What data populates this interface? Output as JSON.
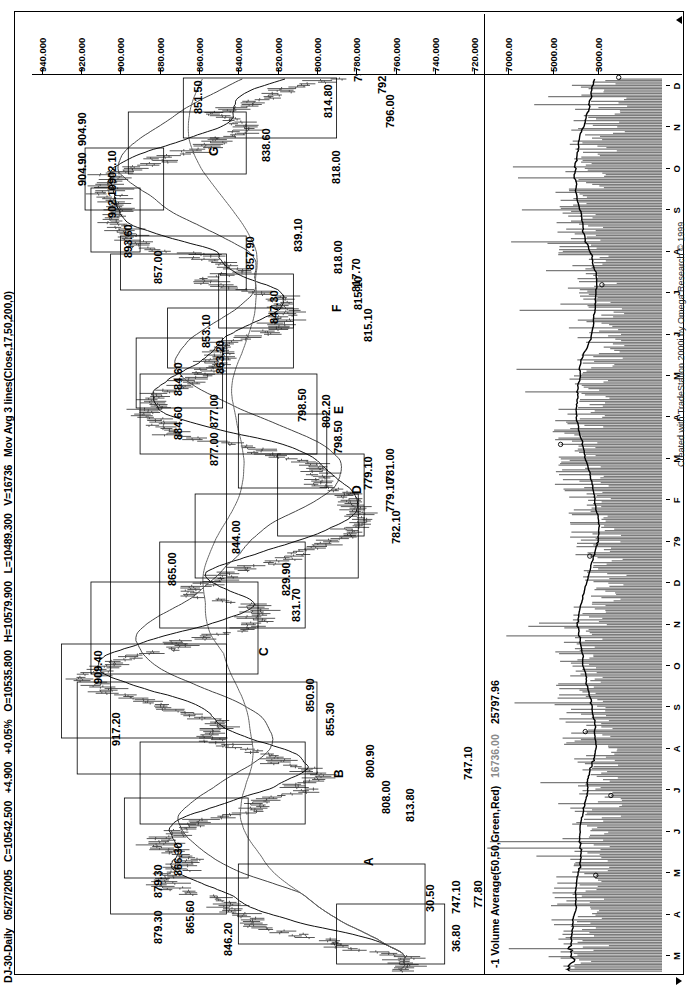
{
  "header": {
    "symbol": "DJ-30-Daily",
    "date": "05/27/2005",
    "close": "C=10542.500",
    "change": "+4.900",
    "change_pct": "+0.05%",
    "open": "O=10535.800",
    "high": "H=10579.900",
    "low": "L=10489.300",
    "volume": "V=16736",
    "indicator": "Mov Avg 3 lines(Close,17,50,200,0)"
  },
  "volume_pane": {
    "indicator": "-1 Volume Average(50,50,Green,Red)",
    "value_gray": "16736.00",
    "value_avg": "25797.96"
  },
  "footer": {
    "credit": "Created with TradeStation 2000i by Omega Research © 1999"
  },
  "price_axis": {
    "labels": [
      "940.000",
      "920.000",
      "900.000",
      "880.000",
      "860.000",
      "840.000",
      "820.000",
      "800.000",
      "780.000",
      "760.000",
      "740.000",
      "720.000"
    ],
    "values": [
      940,
      920,
      900,
      880,
      860,
      840,
      820,
      800,
      780,
      760,
      740,
      720
    ]
  },
  "volume_axis": {
    "labels": [
      "7000.00",
      "5000.00",
      "3000.00"
    ],
    "values": [
      7000,
      5000,
      3000
    ]
  },
  "time_axis": {
    "labels": [
      "M",
      "A",
      "M",
      "J",
      "J",
      "A",
      "S",
      "O",
      "N",
      "D",
      "79",
      "F",
      "M",
      "A",
      "M",
      "J",
      "J",
      "A",
      "S",
      "O",
      "N",
      "D"
    ]
  },
  "swing_labels": [
    {
      "text": "A",
      "x": 108,
      "y": 330
    },
    {
      "text": "B",
      "x": 196,
      "y": 300
    },
    {
      "text": "C",
      "x": 318,
      "y": 225
    },
    {
      "text": "D",
      "x": 480,
      "y": 318
    },
    {
      "text": "E",
      "x": 560,
      "y": 300
    },
    {
      "text": "F",
      "x": 662,
      "y": 298
    },
    {
      "text": "G",
      "x": 818,
      "y": 175
    }
  ],
  "price_annotations": [
    {
      "text": "36.80",
      "x": 22,
      "y": 418
    },
    {
      "text": "747.10",
      "x": 60,
      "y": 418
    },
    {
      "text": "30.50",
      "x": 62,
      "y": 392
    },
    {
      "text": "77.80",
      "x": 66,
      "y": 440
    },
    {
      "text": "846.20",
      "x": 18,
      "y": 190
    },
    {
      "text": "865.60",
      "x": 40,
      "y": 152
    },
    {
      "text": "879.30",
      "x": 30,
      "y": 120
    },
    {
      "text": "879.30",
      "x": 76,
      "y": 120
    },
    {
      "text": "866.30",
      "x": 98,
      "y": 140
    },
    {
      "text": "813.80",
      "x": 152,
      "y": 372
    },
    {
      "text": "808.00",
      "x": 160,
      "y": 348
    },
    {
      "text": "800.90",
      "x": 196,
      "y": 332
    },
    {
      "text": "747.10",
      "x": 194,
      "y": 430
    },
    {
      "text": "855.30",
      "x": 238,
      "y": 292
    },
    {
      "text": "850.90",
      "x": 262,
      "y": 272
    },
    {
      "text": "917.20",
      "x": 228,
      "y": 78
    },
    {
      "text": "909.40",
      "x": 290,
      "y": 60
    },
    {
      "text": "831.70",
      "x": 352,
      "y": 258
    },
    {
      "text": "829.90",
      "x": 378,
      "y": 248
    },
    {
      "text": "865.00",
      "x": 388,
      "y": 134
    },
    {
      "text": "844.00",
      "x": 420,
      "y": 198
    },
    {
      "text": "782.10",
      "x": 430,
      "y": 358
    },
    {
      "text": "779.10",
      "x": 462,
      "y": 352
    },
    {
      "text": "781.00",
      "x": 492,
      "y": 352
    },
    {
      "text": "779.10",
      "x": 484,
      "y": 330
    },
    {
      "text": "798.50",
      "x": 520,
      "y": 300
    },
    {
      "text": "802.20",
      "x": 546,
      "y": 288
    },
    {
      "text": "798.50",
      "x": 552,
      "y": 264
    },
    {
      "text": "877.00",
      "x": 508,
      "y": 176
    },
    {
      "text": "877.00",
      "x": 546,
      "y": 176
    },
    {
      "text": "884.60",
      "x": 534,
      "y": 140
    },
    {
      "text": "884.60",
      "x": 578,
      "y": 140
    },
    {
      "text": "863.20",
      "x": 600,
      "y": 182
    },
    {
      "text": "853.10",
      "x": 626,
      "y": 168
    },
    {
      "text": "847.30",
      "x": 650,
      "y": 236
    },
    {
      "text": "815.10",
      "x": 632,
      "y": 330
    },
    {
      "text": "815.10",
      "x": 664,
      "y": 320
    },
    {
      "text": "817.70",
      "x": 682,
      "y": 318
    },
    {
      "text": "818.00",
      "x": 700,
      "y": 300
    },
    {
      "text": "857.90",
      "x": 704,
      "y": 212
    },
    {
      "text": "839.10",
      "x": 722,
      "y": 260
    },
    {
      "text": "857.00",
      "x": 690,
      "y": 120
    },
    {
      "text": "893.60",
      "x": 716,
      "y": 90
    },
    {
      "text": "902.10",
      "x": 756,
      "y": 74
    },
    {
      "text": "902.10",
      "x": 790,
      "y": 74
    },
    {
      "text": "904.90",
      "x": 788,
      "y": 44
    },
    {
      "text": "904.90",
      "x": 828,
      "y": 44
    },
    {
      "text": "838.60",
      "x": 812,
      "y": 228
    },
    {
      "text": "851.50",
      "x": 860,
      "y": 160
    },
    {
      "text": "818.00",
      "x": 790,
      "y": 298
    },
    {
      "text": "814.80",
      "x": 856,
      "y": 290
    },
    {
      "text": "796.00",
      "x": 846,
      "y": 352
    },
    {
      "text": "792.20",
      "x": 880,
      "y": 344
    },
    {
      "text": "792.20",
      "x": 892,
      "y": 320
    }
  ],
  "chart_data": {
    "type": "line",
    "xlabel": "",
    "ylabel": "Price",
    "ylim": [
      715,
      945
    ],
    "vol_ylim": [
      0,
      8000
    ],
    "grid": false,
    "legend": "none",
    "series": [
      {
        "name": "Price (OHLC bars)",
        "type": "ohlc"
      },
      {
        "name": "Mov Avg 17",
        "type": "line"
      },
      {
        "name": "Mov Avg 50",
        "type": "line"
      },
      {
        "name": "Mov Avg 200",
        "type": "line"
      },
      {
        "name": "Volume",
        "type": "bar"
      },
      {
        "name": "Volume Average 50",
        "type": "line"
      }
    ],
    "price_swing_points": [
      {
        "label": "A",
        "price": 879.3
      },
      {
        "label": "B",
        "price": 800.9
      },
      {
        "label": "C",
        "price": 850.9
      },
      {
        "label": "D",
        "price": 779.1
      },
      {
        "label": "E",
        "price": 798.5
      },
      {
        "label": "F",
        "price": 815.1
      },
      {
        "label": "G",
        "price": 838.6
      }
    ],
    "notable_prices": [
      30.5,
      77.8,
      36.8,
      747.1,
      846.2,
      865.6,
      879.3,
      866.3,
      813.8,
      808.0,
      800.9,
      855.3,
      850.9,
      917.2,
      909.4,
      831.7,
      829.9,
      865.0,
      844.0,
      782.1,
      779.1,
      781.0,
      798.5,
      802.2,
      877.0,
      884.6,
      863.2,
      853.1,
      847.3,
      815.1,
      817.7,
      818.0,
      857.9,
      839.1,
      857.0,
      893.6,
      902.1,
      904.9,
      838.6,
      851.5,
      814.8,
      796.0,
      792.2
    ],
    "price_axis_ticks": [
      940,
      920,
      900,
      880,
      860,
      840,
      820,
      800,
      780,
      760,
      740,
      720
    ],
    "volume_axis_ticks": [
      7000,
      5000,
      3000
    ],
    "time_ticks": [
      "M",
      "A",
      "M",
      "J",
      "J",
      "A",
      "S",
      "O",
      "N",
      "D",
      "79",
      "F",
      "M",
      "A",
      "M",
      "J",
      "J",
      "A",
      "S",
      "O",
      "N",
      "D"
    ]
  }
}
